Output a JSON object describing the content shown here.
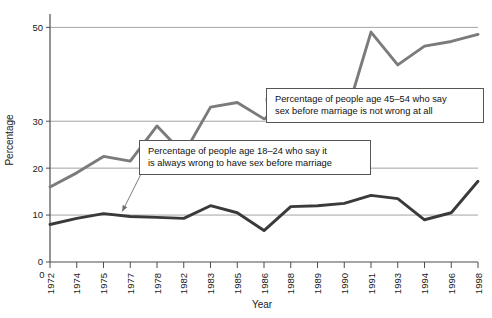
{
  "chart_data": {
    "type": "line",
    "title": "",
    "xlabel": "Year",
    "ylabel": "Percentage",
    "ylim": [
      0,
      52
    ],
    "yticks": [
      0,
      10,
      20,
      30,
      50
    ],
    "ytick_labels": [
      "0",
      "10",
      "20",
      "30",
      "50"
    ],
    "gridlines": [
      10,
      20,
      30,
      50
    ],
    "grid": true,
    "legend_position": "inline-annotations",
    "x_axis_type": "categorical",
    "origin_label": "0",
    "categories": [
      "1972",
      "1974",
      "1975",
      "1977",
      "1978",
      "1982",
      "1983",
      "1985",
      "1986",
      "1988",
      "1989",
      "1990",
      "1991",
      "1993",
      "1994",
      "1996",
      "1998"
    ],
    "series": [
      {
        "name": "Percentage of people age 45–54 who say sex before marriage is not wrong at all",
        "short_name": "age-45-54-not-wrong-at-all",
        "color": "#7b7b7b",
        "values": [
          16,
          19,
          22.5,
          21.5,
          29,
          23,
          33,
          34,
          30.5,
          32,
          31,
          30,
          49,
          42,
          46,
          47,
          48.5
        ]
      },
      {
        "name": "Percentage of people age 18–24 who say it is always wrong to have sex before marriage",
        "short_name": "age-18-24-always-wrong",
        "color": "#3a3a3a",
        "values": [
          8,
          9.3,
          10.3,
          9.7,
          9.5,
          9.3,
          12,
          10.5,
          6.7,
          11.8,
          12,
          12.5,
          14.2,
          13.5,
          9,
          10.5,
          17.2
        ]
      }
    ],
    "annotations": [
      {
        "id": "upper",
        "line1": "Percentage of people age 45–54 who say",
        "line2": "sex before marriage is not wrong at all",
        "target_category": "1986",
        "points_to_series": "age-45-54-not-wrong-at-all"
      },
      {
        "id": "lower",
        "line1": "Percentage of people age 18–24 who say it",
        "line2": "is always wrong to have sex before marriage",
        "target_category": "1977",
        "points_to_series": "age-18-24-always-wrong"
      }
    ]
  }
}
